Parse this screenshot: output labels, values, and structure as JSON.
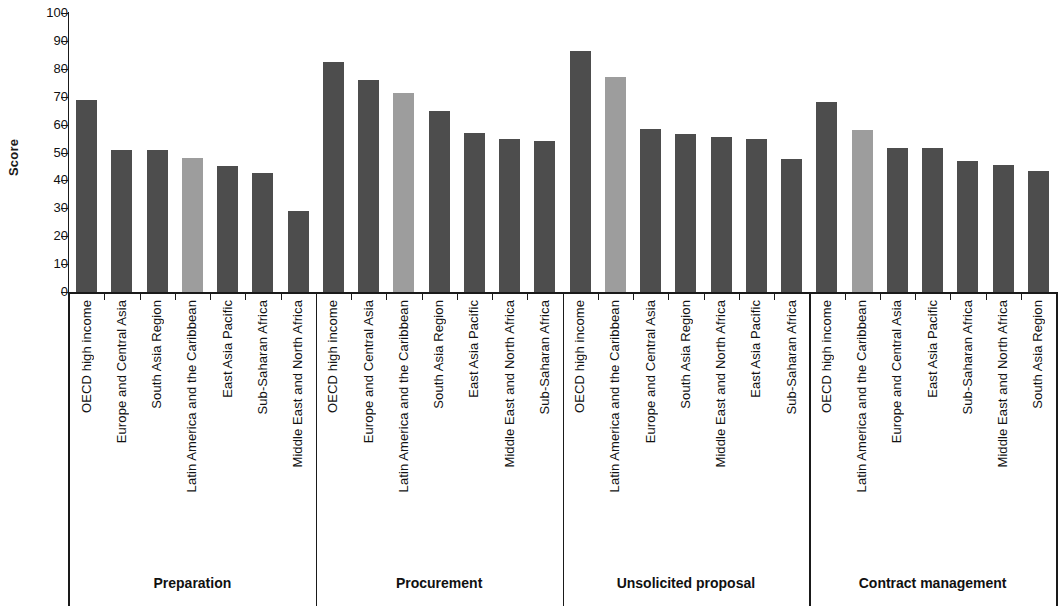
{
  "chart_data": {
    "type": "bar",
    "title": "",
    "xlabel": "",
    "ylabel": "Score",
    "ylim": [
      0,
      100
    ],
    "ytick_step": 10,
    "yticks": [
      100,
      90,
      80,
      70,
      60,
      50,
      40,
      30,
      20,
      10,
      0
    ],
    "grid": false,
    "legend": "none",
    "colors": {
      "default_bar": "#4d4d4d",
      "highlight_bar": "#9d9d9d",
      "axis": "#1a1a1a",
      "background": "#ffffff"
    },
    "highlight_category": "Latin America and the Caribbean",
    "groups": [
      {
        "name": "Preparation",
        "categories": [
          "OECD high income",
          "Europe and Central Asia",
          "South Asia Region",
          "Latin America and the Caribbean",
          "East Asia Pacific",
          "Sub-Saharan Africa",
          "Middle East and North Africa"
        ],
        "values": [
          68.8,
          51.0,
          51.0,
          48.0,
          45.0,
          42.5,
          29.0
        ],
        "highlighted": [
          false,
          false,
          false,
          true,
          false,
          false,
          false
        ]
      },
      {
        "name": "Procurement",
        "categories": [
          "OECD high income",
          "Europe and Central Asia",
          "Latin America and the Caribbean",
          "South Asia Region",
          "East Asia Pacific",
          "Middle East and North Africa",
          "Sub-Saharan Africa"
        ],
        "values": [
          82.5,
          76.0,
          71.5,
          65.0,
          57.0,
          55.0,
          54.0
        ],
        "highlighted": [
          false,
          false,
          true,
          false,
          false,
          false,
          false
        ]
      },
      {
        "name": "Unsolicited proposal",
        "categories": [
          "OECD high income",
          "Latin America and the Caribbean",
          "Europe and Central Asia",
          "South Asia Region",
          "Middle East and North Africa",
          "East Asia Pacific",
          "Sub-Saharan Africa"
        ],
        "values": [
          86.5,
          77.0,
          58.5,
          56.5,
          55.5,
          55.0,
          47.5
        ],
        "highlighted": [
          false,
          true,
          false,
          false,
          false,
          false,
          false
        ]
      },
      {
        "name": "Contract management",
        "categories": [
          "OECD high income",
          "Latin America and the Caribbean",
          "Europe and Central Asia",
          "East Asia Pacific",
          "Sub-Saharan Africa",
          "Middle East and North Africa",
          "South Asia Region"
        ],
        "values": [
          68.0,
          58.0,
          51.5,
          51.5,
          47.0,
          45.5,
          43.5
        ],
        "highlighted": [
          false,
          true,
          false,
          false,
          false,
          false,
          false
        ]
      }
    ]
  }
}
